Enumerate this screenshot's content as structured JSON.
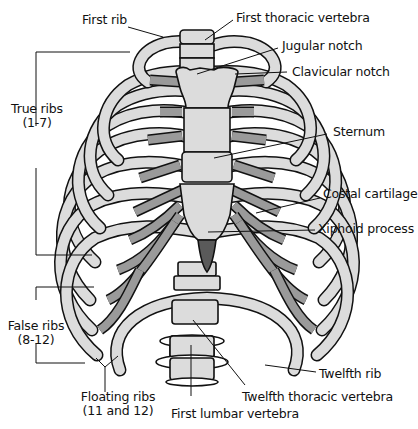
{
  "diagram": {
    "colors": {
      "bone": "#dcdcdc",
      "cartilage": "#9a9a9a",
      "xiphoid": "#5a5a5a",
      "outline": "#111111",
      "background": "#ffffff"
    },
    "labels": {
      "first_rib": "First rib",
      "first_thoracic_vertebra": "First thoracic vertebra",
      "jugular_notch": "Jugular notch",
      "clavicular_notch": "Clavicular notch",
      "true_ribs": "True ribs",
      "true_ribs_range": "(1-7)",
      "sternum": "Sternum",
      "costal_cartilage": "Costal cartilage",
      "xiphoid_process": "Xiphoid process",
      "false_ribs": "False ribs",
      "false_ribs_range": "(8-12)",
      "twelfth_rib": "Twelfth rib",
      "floating_ribs": "Floating ribs",
      "floating_ribs_range": "(11 and 12)",
      "twelfth_thoracic_vertebra": "Twelfth thoracic vertebra",
      "first_lumbar_vertebra": "First lumbar vertebra"
    }
  }
}
